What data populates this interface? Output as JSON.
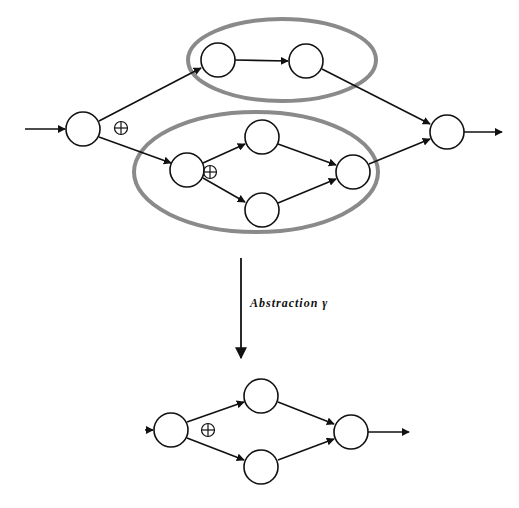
{
  "diagram": {
    "type": "workflow-abstraction",
    "abstraction_label": "Abstraction γ",
    "operator_symbol": "⊕",
    "colors": {
      "stroke": "#111111",
      "region": "#8a8a8a",
      "background": "#ffffff"
    },
    "before": {
      "nodes": [
        {
          "id": "n0",
          "x": 83,
          "y": 129
        },
        {
          "id": "n1",
          "x": 218,
          "y": 60
        },
        {
          "id": "n2",
          "x": 306,
          "y": 61
        },
        {
          "id": "n3",
          "x": 187,
          "y": 170
        },
        {
          "id": "n4",
          "x": 262,
          "y": 137
        },
        {
          "id": "n5",
          "x": 262,
          "y": 210
        },
        {
          "id": "n6",
          "x": 353,
          "y": 172
        },
        {
          "id": "n7",
          "x": 447,
          "y": 132
        }
      ],
      "edges": [
        [
          "in",
          "n0"
        ],
        [
          "n0",
          "n1"
        ],
        [
          "n0",
          "n3"
        ],
        [
          "n1",
          "n2"
        ],
        [
          "n2",
          "n7"
        ],
        [
          "n3",
          "n4"
        ],
        [
          "n3",
          "n5"
        ],
        [
          "n4",
          "n6"
        ],
        [
          "n5",
          "n6"
        ],
        [
          "n6",
          "n7"
        ],
        [
          "n7",
          "out"
        ]
      ],
      "operators": [
        {
          "symbol": "⊕",
          "x": 121,
          "y": 128
        },
        {
          "symbol": "⊕",
          "x": 210,
          "y": 172
        }
      ],
      "regions": [
        {
          "id": "upper-region",
          "cx": 282,
          "cy": 60,
          "rx": 94,
          "ry": 41
        },
        {
          "id": "lower-region",
          "cx": 256,
          "cy": 172,
          "rx": 122,
          "ry": 60
        }
      ]
    },
    "after": {
      "nodes": [
        {
          "id": "b0",
          "x": 171,
          "y": 430
        },
        {
          "id": "b1",
          "x": 261,
          "y": 396
        },
        {
          "id": "b2",
          "x": 261,
          "y": 467
        },
        {
          "id": "b3",
          "x": 351,
          "y": 432
        }
      ],
      "edges": [
        [
          "in",
          "b0"
        ],
        [
          "b0",
          "b1"
        ],
        [
          "b0",
          "b2"
        ],
        [
          "b1",
          "b3"
        ],
        [
          "b2",
          "b3"
        ],
        [
          "b3",
          "out"
        ]
      ],
      "operators": [
        {
          "symbol": "⊕",
          "x": 208,
          "y": 430
        }
      ]
    }
  }
}
